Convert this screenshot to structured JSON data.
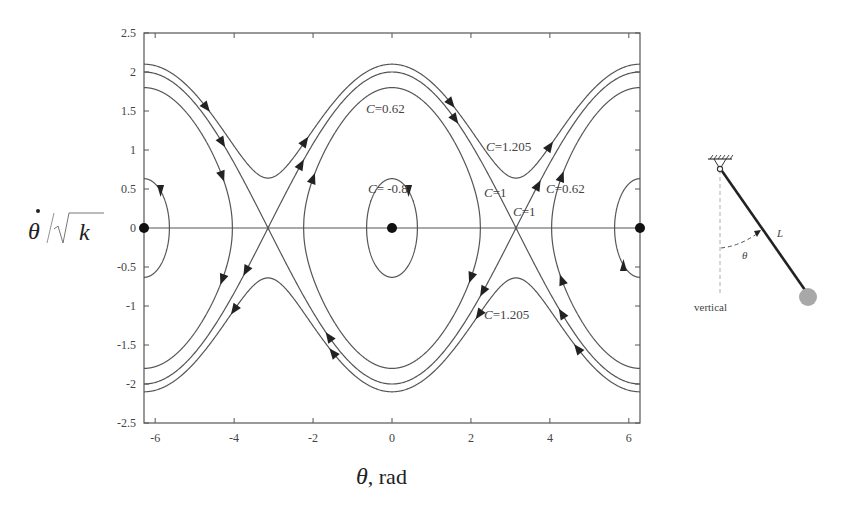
{
  "chart_data": {
    "type": "line",
    "title": "",
    "xlabel": "θ, rad",
    "ylabel": "θ̇/√k",
    "xlim": [
      -6.2832,
      6.2832
    ],
    "ylim": [
      -2.5,
      2.5
    ],
    "xticks": [
      -6,
      -4,
      -2,
      0,
      2,
      4,
      6
    ],
    "yticks": [
      2.5,
      2,
      1.5,
      1,
      0.5,
      0,
      -0.5,
      -1,
      -1.5,
      -2,
      -2.5
    ],
    "grid": false,
    "legend": null,
    "equation": "(θ̇/√k)² / 2 − cos θ = C",
    "series": [
      {
        "name": "C=1.205",
        "C": 1.205,
        "kind": "rotating",
        "vmax": 2.1,
        "vmin": 0.64
      },
      {
        "name": "C=1",
        "C": 1.0,
        "kind": "separatrix",
        "vmax": 2.0,
        "vmin": 0.0
      },
      {
        "name": "C=0.62",
        "C": 0.62,
        "kind": "oscillating",
        "vmax": 1.8,
        "theta_limit": 2.24
      },
      {
        "name": "C=-0.8",
        "C": -0.8,
        "kind": "oscillating",
        "vmax": 0.63,
        "theta_limit": 0.64
      }
    ],
    "equilibria_stable": [
      {
        "x": -6.2832,
        "y": 0
      },
      {
        "x": 0,
        "y": 0
      },
      {
        "x": 6.2832,
        "y": 0
      }
    ],
    "saddle_points": [
      {
        "x": -3.1416,
        "y": 0
      },
      {
        "x": 3.1416,
        "y": 0
      }
    ],
    "annotations": [
      {
        "text": "C=0.62",
        "x": -0.5,
        "y": 1.48
      },
      {
        "text": "C=1.205",
        "x": 2.3,
        "y": 0.95
      },
      {
        "text": "C= -0.8",
        "x": -0.4,
        "y": 0.5
      },
      {
        "text": "C=1",
        "x": 2.3,
        "y": 0.33
      },
      {
        "text": "C=0.62",
        "x": 3.9,
        "y": 0.33
      },
      {
        "text": "C=1",
        "x": 2.9,
        "y": 0.12
      },
      {
        "text": "C=1.205",
        "x": 2.3,
        "y": -1.45
      }
    ]
  },
  "axes": {
    "x_title_symbol": "θ",
    "x_title_unit": ", rad",
    "y_title_num": "θ",
    "y_title_den": "k",
    "xtick_labels": [
      "-6",
      "-4",
      "-2",
      "0",
      "2",
      "4",
      "6"
    ],
    "ytick_labels": [
      "2.5",
      "2",
      "1.5",
      "1",
      "0.5",
      "0",
      "-0.5",
      "-1",
      "-1.5",
      "-2",
      "-2.5"
    ]
  },
  "labels": {
    "c062_top": "=0.62",
    "c1205_top": "=1.205",
    "cm08": "= -0.8",
    "c1_left": "=1",
    "c062_right": "=0.62",
    "c1_right": "=1",
    "c1205_bottom": "=1.205",
    "c_symbol": "C"
  },
  "pendulum": {
    "length_label": "L",
    "angle_label": "θ",
    "reference_label": "vertical"
  },
  "colors": {
    "curve": "#555555",
    "axis": "#555555",
    "arrow": "#222222",
    "point": "#111111",
    "bob": "#a8a8a8",
    "rod": "#222222"
  }
}
